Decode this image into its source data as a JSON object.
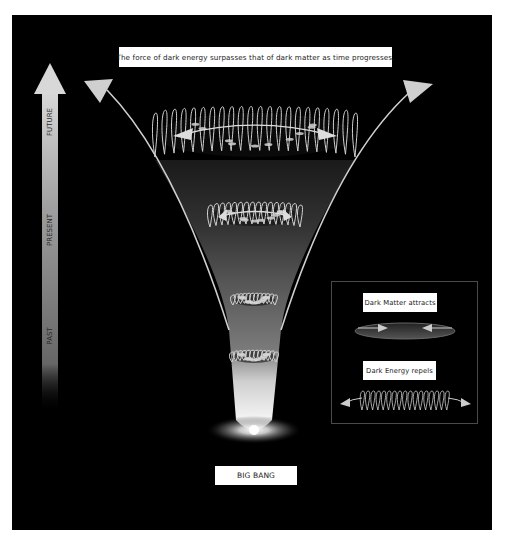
{
  "title": "The force of dark energy surpasses that of dark matter as time progresses.",
  "timeline": {
    "labels": [
      "FUTURE",
      "PRESENT",
      "PAST"
    ],
    "direction": "up"
  },
  "funnel": {
    "stages": [
      {
        "name": "future-expansion-ring",
        "type": "dark-energy-spring"
      },
      {
        "name": "present-ring",
        "type": "dark-energy-spring"
      },
      {
        "name": "past-disc-1",
        "type": "galaxy-disc"
      },
      {
        "name": "past-disc-2",
        "type": "galaxy-disc"
      }
    ]
  },
  "origin_label": "BIG BANG",
  "legend": {
    "dark_matter_label": "Dark Matter attracts",
    "dark_energy_label": "Dark Energy repels"
  },
  "colors": {
    "background": "#000000",
    "page": "#ffffff",
    "arrow": "#cfcfcf",
    "label_box": "#ffffff",
    "legend_border": "#4a4a4a"
  }
}
